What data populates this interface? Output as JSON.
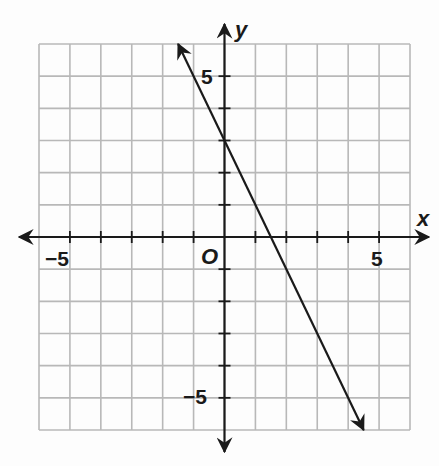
{
  "chart_data": {
    "type": "line",
    "title": "",
    "xlabel": "x",
    "ylabel": "y",
    "origin_label": "O",
    "xlim": [
      -6,
      6
    ],
    "ylim": [
      -6,
      6
    ],
    "grid": true,
    "grid_step": 1,
    "x_tick_labels": [
      {
        "value": -5,
        "label": "−5"
      },
      {
        "value": 5,
        "label": "5"
      }
    ],
    "y_tick_labels": [
      {
        "value": 5,
        "label": "5"
      },
      {
        "value": -5,
        "label": "−5"
      }
    ],
    "series": [
      {
        "name": "line",
        "equation": "y = -2x + 3",
        "slope": -2,
        "y_intercept": 3,
        "x_intercept": 1.5,
        "points": [
          {
            "x": -1.5,
            "y": 6
          },
          {
            "x": 0,
            "y": 3
          },
          {
            "x": 1.5,
            "y": 0
          },
          {
            "x": 4.5,
            "y": -6
          }
        ],
        "arrows_both_ends": true,
        "color": "#1a1a1a"
      }
    ],
    "legend": null
  },
  "colors": {
    "grid": "#b8b8b8",
    "axis": "#1a1a1a",
    "background": "#fdfdfd"
  }
}
